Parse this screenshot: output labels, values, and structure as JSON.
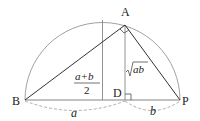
{
  "diagram": {
    "type": "geometry",
    "points": {
      "A": {
        "label": "A",
        "x": 125,
        "y": 25
      },
      "B": {
        "label": "B",
        "x": 25,
        "y": 100
      },
      "P": {
        "label": "P",
        "x": 180,
        "y": 100
      },
      "D": {
        "label": "D",
        "x": 125,
        "y": 100
      }
    },
    "labels": {
      "mean_num": "a+b",
      "mean_den": "2",
      "sqrt_body": "ab",
      "seg_a": "a",
      "seg_b": "b"
    },
    "colors": {
      "stroke": "#333333",
      "thin": "#777777",
      "dashed": "#999999"
    }
  }
}
